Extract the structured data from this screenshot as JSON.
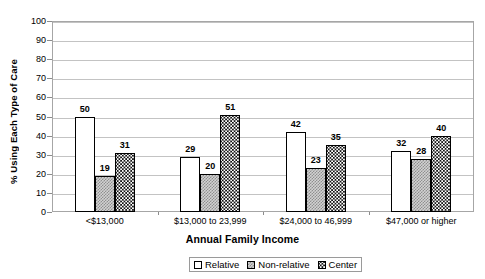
{
  "chart_data": {
    "type": "bar",
    "title": "",
    "xlabel": "Annual Family Income",
    "ylabel": "% Using Each Type of Care",
    "ylim": [
      0,
      100
    ],
    "ytick_step": 10,
    "yticks": [
      "100",
      "90",
      "80",
      "70",
      "60",
      "50",
      "40",
      "30",
      "20",
      "10",
      "0"
    ],
    "grid": true,
    "grid_axis": "y",
    "legend_position": "bottom",
    "categories": [
      "<$13,000",
      "$13,000 to 23,999",
      "$24,000 to 46,999",
      "$47,000 or higher"
    ],
    "series": [
      {
        "name": "Relative",
        "values": [
          50,
          29,
          42,
          32
        ],
        "pattern": "light-dotted",
        "color": "#ffffff"
      },
      {
        "name": "Non-relative",
        "values": [
          19,
          20,
          23,
          28
        ],
        "pattern": "gray-crosshatch",
        "color": "#d2d2d2"
      },
      {
        "name": "Center",
        "values": [
          31,
          51,
          35,
          40
        ],
        "pattern": "black-dotted",
        "color": "#121212"
      }
    ],
    "data_labels": true
  },
  "axes": {
    "y_title": "% Using Each Type of Care",
    "x_title": "Annual Family Income"
  },
  "legend": {
    "items": [
      {
        "label": "Relative"
      },
      {
        "label": "Non-relative"
      },
      {
        "label": "Center"
      }
    ]
  }
}
